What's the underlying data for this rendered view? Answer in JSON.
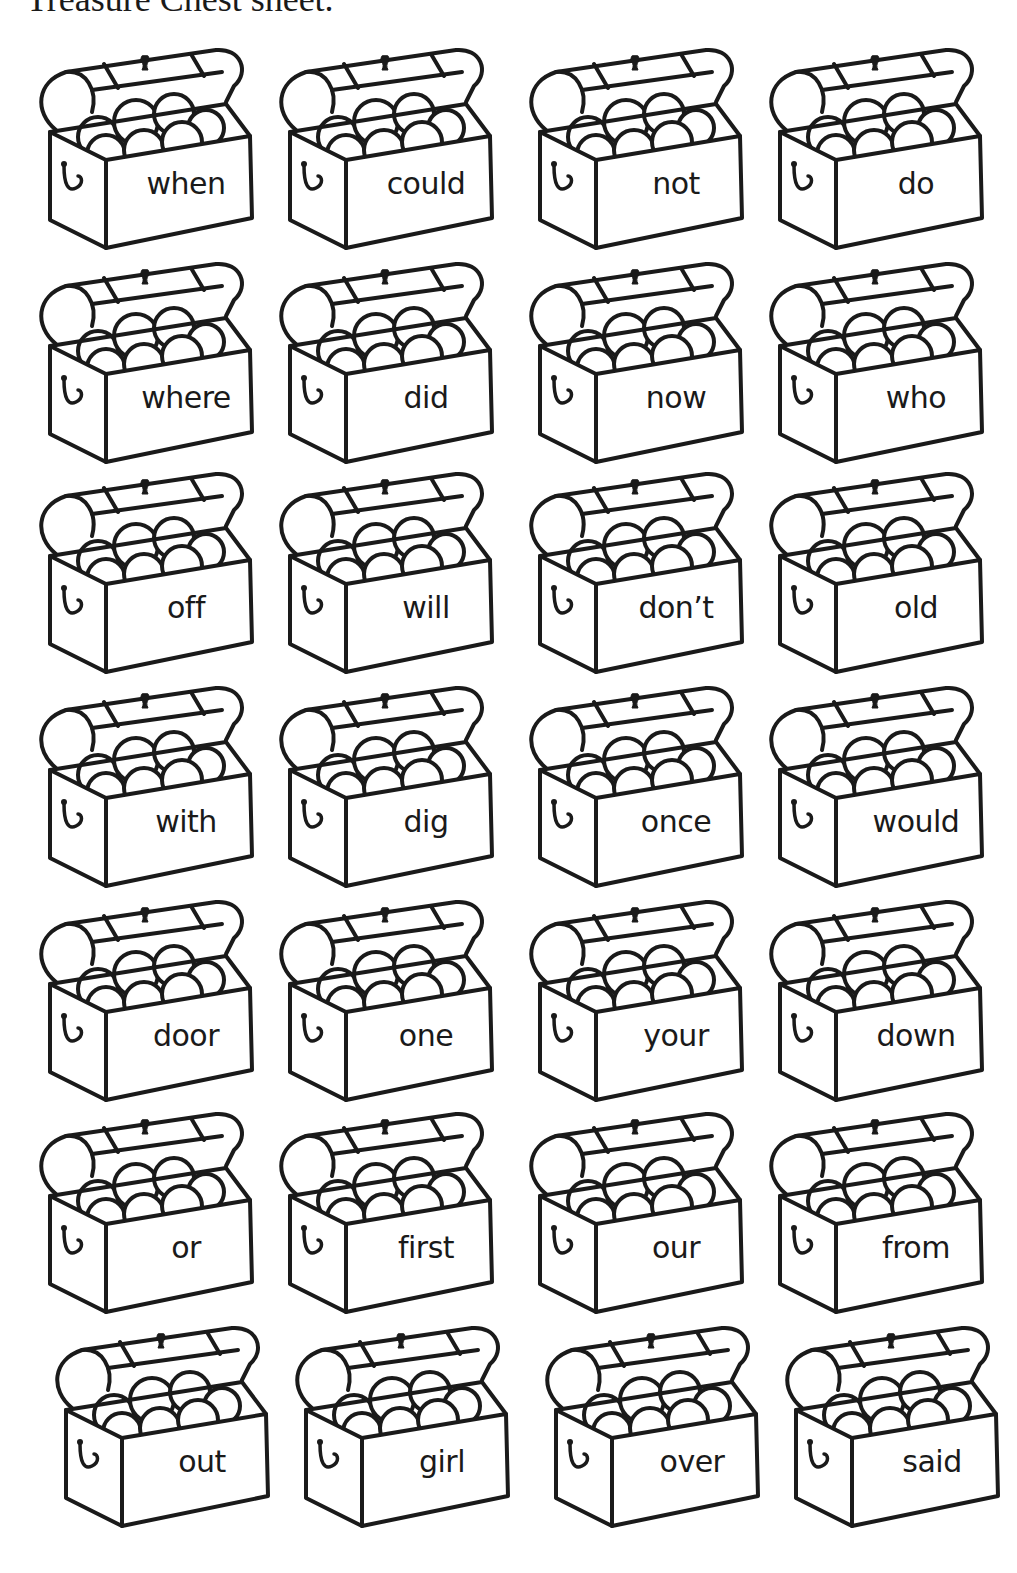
{
  "heading": "Treasure Chest sheet.",
  "chests": [
    {
      "word": "when"
    },
    {
      "word": "could"
    },
    {
      "word": "not"
    },
    {
      "word": "do"
    },
    {
      "word": "where"
    },
    {
      "word": "did"
    },
    {
      "word": "now"
    },
    {
      "word": "who"
    },
    {
      "word": "off"
    },
    {
      "word": "will"
    },
    {
      "word": "don’t"
    },
    {
      "word": "old"
    },
    {
      "word": "with"
    },
    {
      "word": "dig"
    },
    {
      "word": "once"
    },
    {
      "word": "would"
    },
    {
      "word": "door"
    },
    {
      "word": "one"
    },
    {
      "word": "your"
    },
    {
      "word": "down"
    },
    {
      "word": "or"
    },
    {
      "word": "first"
    },
    {
      "word": "our"
    },
    {
      "word": "from"
    },
    {
      "word": "out"
    },
    {
      "word": "girl"
    },
    {
      "word": "over"
    },
    {
      "word": "said"
    }
  ],
  "grid": {
    "columns": 4,
    "rows": 7
  },
  "colors": {
    "ink": "#1a1a1a",
    "paper": "#ffffff"
  }
}
